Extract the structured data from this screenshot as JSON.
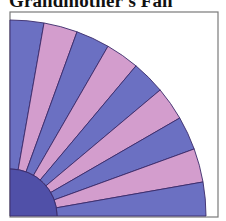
{
  "title": "Grandmother's Fan",
  "colors": {
    "blue_blade": "#6b70c2",
    "pink_blade": "#d39dcd",
    "center": "#5050a8",
    "seam": "#3a2a6a",
    "frame": "#7a7a7a",
    "background": "#ffffff"
  },
  "fan": {
    "blade_count": 9,
    "blade_colors": [
      "blue",
      "pink",
      "blue",
      "pink",
      "blue",
      "pink",
      "blue",
      "pink",
      "blue"
    ],
    "center_x": 10,
    "center_y": 216,
    "outer_radius": 196,
    "inner_radius": 47
  },
  "frame": {
    "x": 10,
    "y": 12,
    "width": 208,
    "height": 205
  }
}
